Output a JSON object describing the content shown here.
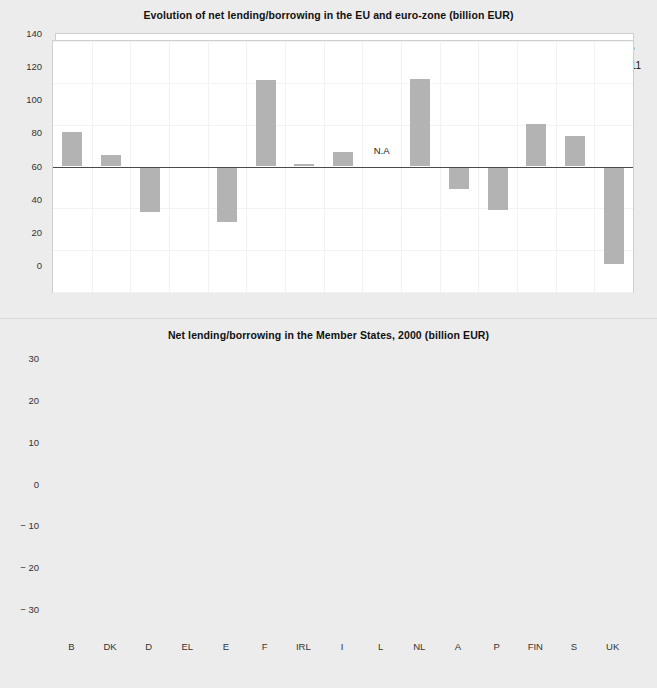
{
  "chart_data": [
    {
      "type": "line",
      "title": "Evolution of net lending/borrowing in the EU and euro-zone (billion EUR)",
      "xlabel": "",
      "ylabel": "",
      "categories": [
        "1996",
        "1997",
        "1998",
        "1999",
        "2000"
      ],
      "ylim": [
        0,
        140
      ],
      "yticks": [
        "0",
        "20",
        "40",
        "60",
        "80",
        "100",
        "120",
        "140"
      ],
      "grid": false,
      "legend_position": "top-right",
      "series": [
        {
          "name": "EU-15",
          "color": "#8e8e8e",
          "values": [
            76.7,
            122.5,
            82.7,
            43.0,
            11.5
          ],
          "labels": [
            "76.7",
            "122.5",
            "82.7",
            "43.0",
            "11.5"
          ]
        },
        {
          "name": "EUR-11",
          "color": "#111111",
          "values": [
            69.4,
            102.5,
            75.1,
            45.3,
            24.6
          ],
          "labels": [
            "69.4",
            "102.5",
            "75.1",
            "45.3",
            "24.6"
          ]
        }
      ]
    },
    {
      "type": "bar",
      "title": "Net lending/borrowing in the Member States, 2000 (billion EUR)",
      "xlabel": "",
      "ylabel": "",
      "categories": [
        "B",
        "DK",
        "D",
        "EL",
        "E",
        "F",
        "IRL",
        "I",
        "L",
        "NL",
        "A",
        "P",
        "FIN",
        "S",
        "UK"
      ],
      "values": [
        8.3,
        2.7,
        -10.8,
        -0.2,
        -13.2,
        20.6,
        0.7,
        3.4,
        null,
        20.9,
        -5.3,
        -10.3,
        10.2,
        7.4,
        -23.4
      ],
      "annotations": [
        {
          "category": "L",
          "text": "N.A",
          "value": 4.0
        }
      ],
      "ylim": [
        -30,
        30
      ],
      "yticks": [
        "30",
        "20",
        "10",
        "0",
        "− 10",
        "− 20",
        "− 30"
      ],
      "bar_color": "#b3b3b3",
      "grid": true
    }
  ],
  "colors": {
    "page_background": "#ececec",
    "plot_background": "#ffffff",
    "gridline": "#f2f2f2",
    "series_eu15": "#8e8e8e",
    "series_eur11": "#111111",
    "bar_fill": "#b3b3b3",
    "axis": "#4a4a4a"
  }
}
